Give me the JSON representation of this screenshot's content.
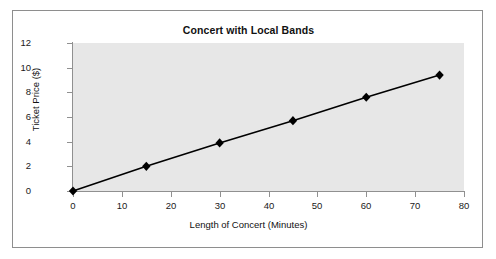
{
  "chart_data": {
    "type": "line",
    "title": "Concert with Local Bands",
    "xlabel": "Length of Concert (Minutes)",
    "ylabel": "Ticket Price ($)",
    "x": [
      0,
      15,
      30,
      45,
      60,
      75
    ],
    "values": [
      0,
      2.0,
      3.9,
      5.7,
      7.6,
      9.4
    ],
    "series": [
      {
        "name": "Ticket Price",
        "x": [
          0,
          15,
          30,
          45,
          60,
          75
        ],
        "values": [
          0,
          2.0,
          3.9,
          5.7,
          7.6,
          9.4
        ]
      }
    ],
    "xlim": [
      0,
      80
    ],
    "ylim": [
      0,
      12
    ],
    "xticks": [
      "0",
      "10",
      "20",
      "30",
      "40",
      "50",
      "60",
      "70",
      "80"
    ],
    "xtick_values": [
      0,
      10,
      20,
      30,
      40,
      50,
      60,
      70,
      80
    ],
    "yticks": [
      "0",
      "2",
      "4",
      "6",
      "8",
      "10",
      "12"
    ],
    "ytick_values": [
      0,
      2,
      4,
      6,
      8,
      10,
      12
    ],
    "grid": false,
    "legend": false,
    "marker": "diamond",
    "line_color": "#000000",
    "marker_color": "#000000",
    "plot_background": "#e7e7e7",
    "figure_background": "#ffffff",
    "axis_color": "#909090",
    "frame_border_color": "#8e8e8e"
  }
}
